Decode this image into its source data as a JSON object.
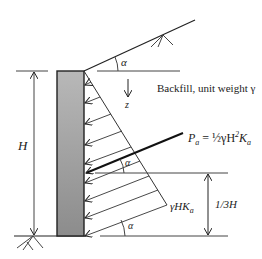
{
  "diagram": {
    "type": "retaining-wall-active-earth-pressure",
    "labels": {
      "height": "H",
      "slope_angle_top": "α",
      "depth_axis": "z",
      "backfill": "Backfill, unit weight γ",
      "resultant": "Pa = ½γH²Ka",
      "resultant_sym": "P",
      "resultant_sub": "a",
      "resultant_eq": " = ½γH",
      "resultant_sup": "2",
      "resultant_k": "K",
      "resultant_ksub": "a",
      "pressure_base": "γHKa",
      "pressure_base_main": "γHK",
      "pressure_base_sub": "a",
      "resultant_angle": "α",
      "resultant_height": "1/3H",
      "base_angle": "α"
    },
    "colors": {
      "line": "#222222",
      "wall_fill_top": "#b5b5b5",
      "wall_fill_bottom": "#8a8a8a",
      "background": "#ffffff"
    },
    "pressure_arrow_count": 9
  }
}
